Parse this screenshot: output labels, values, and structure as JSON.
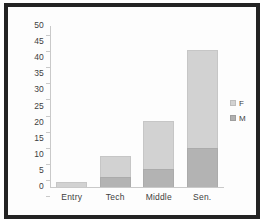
{
  "chart_data": {
    "type": "bar",
    "stacked": true,
    "title": "",
    "xlabel": "",
    "ylabel": "",
    "categories": [
      "Entry",
      "Tech",
      "Middle",
      "Sen."
    ],
    "series": [
      {
        "name": "M",
        "values": [
          0,
          3,
          5.5,
          12
        ]
      },
      {
        "name": "F",
        "values": [
          1.7,
          6.5,
          15,
          30.5
        ]
      }
    ],
    "totals": [
      1.7,
      9.5,
      20.5,
      42.5
    ],
    "ylim": [
      0,
      50
    ],
    "yticks": [
      0,
      5,
      10,
      15,
      20,
      25,
      30,
      35,
      40,
      45,
      50
    ],
    "ytick_labels": [
      "0",
      "5",
      "10",
      "15",
      "20",
      "25",
      "30",
      "35",
      "40",
      "45",
      "50"
    ],
    "grid": false,
    "legend": {
      "position": "right",
      "entries": [
        {
          "label": "F",
          "color": "#d2d2d2"
        },
        {
          "label": "M",
          "color": "#b0b0b0"
        }
      ]
    },
    "colors": {
      "female": "#d2d2d2",
      "male": "#b0b0b0",
      "axis": "#c9c9c9",
      "text": "#3d3d3d",
      "frame": "#232323",
      "background": "#ffffff"
    }
  }
}
